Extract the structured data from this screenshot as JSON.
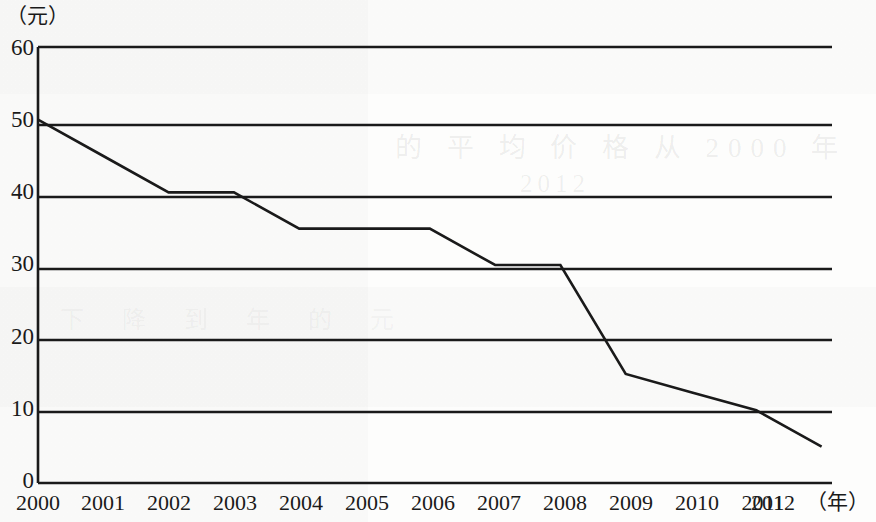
{
  "chart_data": {
    "type": "line",
    "title": "",
    "xlabel": "年",
    "ylabel": "元",
    "x": [
      "2000",
      "2001",
      "2002",
      "2003",
      "2004",
      "2005",
      "2006",
      "2007",
      "2008",
      "2009",
      "2010",
      "2011",
      "2012"
    ],
    "values": [
      50,
      45,
      40,
      40,
      35,
      35,
      35,
      30,
      30,
      15,
      12.5,
      10,
      5
    ],
    "series": [
      {
        "name": "价格",
        "values": [
          50,
          45,
          40,
          40,
          35,
          35,
          35,
          30,
          30,
          15,
          12.5,
          10,
          5
        ]
      }
    ],
    "xlim": [
      "2000",
      "2012"
    ],
    "ylim": [
      0,
      60
    ],
    "yticks": [
      0,
      10,
      20,
      30,
      40,
      50,
      60
    ],
    "xticks": [
      "2000",
      "2001",
      "2002",
      "2003",
      "2004",
      "2005",
      "2006",
      "2007",
      "2008",
      "2009",
      "2010",
      "2011",
      "2012"
    ],
    "grid": "horizontal",
    "legend": "none",
    "line_color": "#1a1a1a"
  },
  "axes": {
    "y_unit_label": "（元）",
    "x_unit_label": "（年）",
    "y_tick_labels": [
      "60",
      "50",
      "40",
      "30",
      "20",
      "10",
      "0"
    ],
    "x_tick_labels": [
      "2000",
      "2001",
      "2002",
      "2003",
      "2004",
      "2005",
      "2006",
      "2007",
      "2008",
      "2009",
      "2010",
      "2011",
      "2012"
    ]
  },
  "background": {
    "bleed_line_1": "的 平 均 价 格 从 2000 年",
    "bleed_line_2": "2012",
    "bleed_line_3": "下 降 到 年 的 元"
  }
}
